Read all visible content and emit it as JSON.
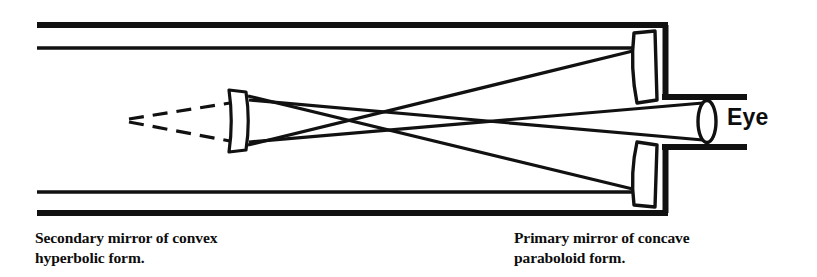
{
  "figure": {
    "background_color": "#ffffff",
    "ink_color": "#111111"
  },
  "labels": {
    "eye": "Eye",
    "caption_secondary": "Secondary mirror of convex\nhyperbolic form.",
    "caption_primary": "Primary mirror of concave\nparaboloid form."
  },
  "components": {
    "telescope_tube": "telescope-tube",
    "primary_mirror_upper": "primary-mirror-upper-segment",
    "primary_mirror_lower": "primary-mirror-lower-segment",
    "secondary_mirror": "secondary-mirror",
    "eyepiece_lens": "eyepiece-lens",
    "eyepiece_barrel": "eyepiece-barrel",
    "incoming_ray_upper": "incoming-light-ray-upper",
    "incoming_ray_lower": "incoming-light-ray-lower",
    "reflected_ray_upper": "reflected-ray-upper",
    "reflected_ray_lower": "reflected-ray-lower",
    "converging_ray_upper": "converging-ray-upper",
    "converging_ray_lower": "converging-ray-lower",
    "virtual_focus_dashed_upper": "virtual-focus-dashed-line-upper",
    "virtual_focus_dashed_lower": "virtual-focus-dashed-line-lower"
  },
  "geometry": {
    "tube_left_x": 37,
    "tube_right_x": 668,
    "tube_top_y": 25,
    "tube_bottom_y": 213,
    "ray_top_y": 48,
    "ray_bottom_y": 192,
    "axis_y": 121,
    "virtual_focus_x": 128,
    "virtual_focus_y": 120,
    "secondary_mirror_x": 236,
    "primary_mirror_x": 650,
    "eyepiece_lens_x": 707,
    "ray_crossing_x": 505
  }
}
